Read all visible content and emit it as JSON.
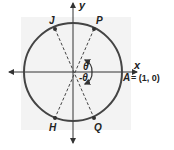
{
  "diagram": {
    "type": "unit-circle",
    "axes": {
      "x_label": "x",
      "y_label": "y"
    },
    "points": {
      "J": {
        "label": "J"
      },
      "P": {
        "label": "P"
      },
      "H": {
        "label": "H"
      },
      "Q": {
        "label": "Q"
      },
      "A": {
        "label": "A",
        "equation": "= (1, 0)"
      }
    },
    "angles": [
      {
        "label": "θ",
        "position": "above x-axis"
      },
      {
        "label": "-θ",
        "position": "below x-axis"
      }
    ],
    "colors": {
      "background_panel": "#f2f2f2",
      "stroke": "#444444",
      "text": "#222222"
    }
  }
}
